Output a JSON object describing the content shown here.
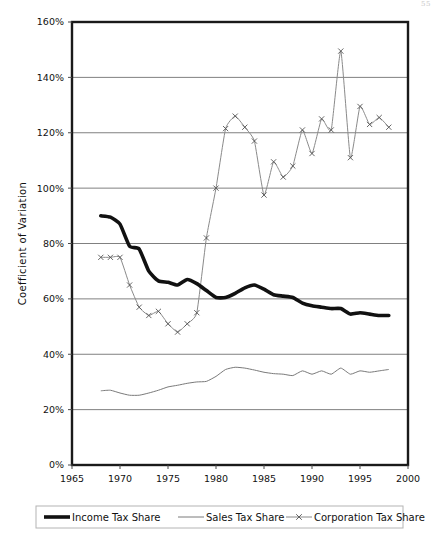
{
  "page": {
    "number": "55"
  },
  "chart_data": {
    "type": "line",
    "title": "",
    "xlabel": "",
    "ylabel": "Coefficient of Variation",
    "xlim": [
      1965,
      2000
    ],
    "ylim": [
      0,
      160
    ],
    "xticks": [
      1965,
      1970,
      1975,
      1980,
      1985,
      1990,
      1995,
      2000
    ],
    "xtick_labels": [
      "1965",
      "1970",
      "1975",
      "1980",
      "1985",
      "1990",
      "1995",
      "2000"
    ],
    "yticks": [
      0,
      20,
      40,
      60,
      80,
      100,
      120,
      140,
      160
    ],
    "ytick_labels": [
      "0%",
      "20%",
      "40%",
      "60%",
      "80%",
      "100%",
      "120%",
      "140%",
      "160%"
    ],
    "grid": true,
    "grid_axis": "y",
    "legend_position": "bottom",
    "y_unit": "percent",
    "series": [
      {
        "name": "Income Tax Share",
        "style": "thick-solid",
        "color": "#111111",
        "marker": "none",
        "x": [
          1968,
          1969,
          1970,
          1971,
          1972,
          1973,
          1974,
          1975,
          1976,
          1977,
          1978,
          1979,
          1980,
          1981,
          1982,
          1983,
          1984,
          1985,
          1986,
          1987,
          1988,
          1989,
          1990,
          1991,
          1992,
          1993,
          1994,
          1995,
          1996,
          1997,
          1998
        ],
        "values": [
          90.0,
          89.5,
          87.0,
          79.0,
          78.0,
          70.0,
          66.5,
          66.0,
          65.0,
          67.0,
          65.5,
          63.0,
          60.5,
          60.5,
          62.0,
          64.0,
          65.0,
          63.5,
          61.5,
          61.0,
          60.5,
          58.5,
          57.5,
          57.0,
          56.5,
          56.5,
          54.5,
          55.0,
          54.5,
          54.0,
          54.0
        ]
      },
      {
        "name": "Sales Tax Share",
        "style": "thin-solid",
        "color": "#7a7a7a",
        "marker": "none",
        "x": [
          1968,
          1969,
          1970,
          1971,
          1972,
          1973,
          1974,
          1975,
          1976,
          1977,
          1978,
          1979,
          1980,
          1981,
          1982,
          1983,
          1984,
          1985,
          1986,
          1987,
          1988,
          1989,
          1990,
          1991,
          1992,
          1993,
          1994,
          1995,
          1996,
          1997,
          1998
        ],
        "values": [
          26.8,
          27.0,
          26.0,
          25.2,
          25.2,
          26.0,
          27.0,
          28.2,
          28.8,
          29.5,
          30.0,
          30.2,
          32.0,
          34.5,
          35.3,
          35.0,
          34.3,
          33.5,
          33.0,
          32.8,
          32.3,
          34.0,
          32.8,
          34.0,
          32.8,
          35.0,
          32.8,
          34.0,
          33.5,
          34.0,
          34.5
        ]
      },
      {
        "name": "Corporation Tax Share",
        "style": "thin-solid-marker",
        "color": "#8a8a8a",
        "marker": "x",
        "x": [
          1968,
          1969,
          1970,
          1971,
          1972,
          1973,
          1974,
          1975,
          1976,
          1977,
          1978,
          1979,
          1980,
          1981,
          1982,
          1983,
          1984,
          1985,
          1986,
          1987,
          1988,
          1989,
          1990,
          1991,
          1992,
          1993,
          1994,
          1995,
          1996,
          1997,
          1998
        ],
        "values": [
          75.0,
          75.0,
          75.0,
          65.0,
          57.0,
          54.0,
          55.5,
          51.0,
          48.0,
          51.0,
          55.0,
          82.0,
          100.0,
          121.5,
          126.0,
          122.0,
          117.0,
          97.5,
          109.5,
          104.0,
          108.0,
          121.0,
          112.5,
          125.0,
          121.0,
          149.5,
          111.0,
          129.5,
          123.0,
          125.5,
          122.0
        ]
      }
    ]
  },
  "legend": {
    "items": [
      {
        "label": "Income Tax Share",
        "swatch": "thick-line"
      },
      {
        "label": "Sales Tax Share",
        "swatch": "thin-line"
      },
      {
        "label": "Corporation Tax Share",
        "swatch": "thin-line-x"
      }
    ]
  }
}
